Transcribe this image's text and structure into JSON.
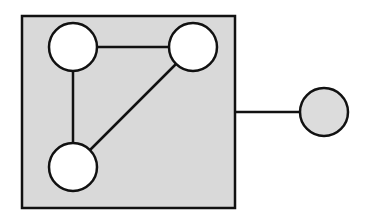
{
  "diagram": {
    "type": "graph",
    "colors": {
      "background": "#ffffff",
      "box_fill": "#d9d9d9",
      "stroke": "#111111",
      "inner_node_fill": "#ffffff",
      "outer_node_fill": "#dcdcdc"
    },
    "box": {
      "x": 22,
      "y": 16,
      "width": 213,
      "height": 192
    },
    "nodes": [
      {
        "id": "n1",
        "cx": 73,
        "cy": 47,
        "r": 24,
        "group": "inside"
      },
      {
        "id": "n2",
        "cx": 193,
        "cy": 47,
        "r": 24,
        "group": "inside"
      },
      {
        "id": "n3",
        "cx": 73,
        "cy": 167,
        "r": 24,
        "group": "inside"
      },
      {
        "id": "n4",
        "cx": 324,
        "cy": 112,
        "r": 24,
        "group": "outside"
      }
    ],
    "edges": [
      {
        "from": "n1",
        "to": "n2"
      },
      {
        "from": "n1",
        "to": "n3"
      },
      {
        "from": "n2",
        "to": "n3"
      }
    ],
    "external_link": {
      "from": "box",
      "to": "n4",
      "y": 112
    }
  }
}
